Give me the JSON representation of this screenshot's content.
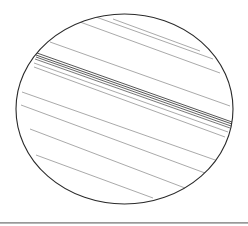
{
  "figure": {
    "type": "ellipse-with-parallel-striations",
    "colors": {
      "background": "#ffffff",
      "outline": "#2a2a2a",
      "lines": "#6e6e6e",
      "band": "#555555",
      "baseline": "#8a8a8a"
    },
    "ellipse": {
      "cx": 124.5,
      "cy": 109,
      "rx": 108.5,
      "ry": 95
    },
    "lines": [
      {
        "x1": 113,
        "y1": 19,
        "x2": 200,
        "y2": 51,
        "w": 0.6
      },
      {
        "x1": 96,
        "y1": 17,
        "x2": 213,
        "y2": 59,
        "w": 0.6
      },
      {
        "x1": 80,
        "y1": 22,
        "x2": 220,
        "y2": 73,
        "w": 0.6
      },
      {
        "x1": 50,
        "y1": 42,
        "x2": 230,
        "y2": 106,
        "w": 0.6
      },
      {
        "x1": 37,
        "y1": 53,
        "x2": 232,
        "y2": 122,
        "w": 1.0
      },
      {
        "x1": 36,
        "y1": 55,
        "x2": 232,
        "y2": 124,
        "w": 1.0
      },
      {
        "x1": 36,
        "y1": 57,
        "x2": 231,
        "y2": 126,
        "w": 0.9
      },
      {
        "x1": 35,
        "y1": 59,
        "x2": 230,
        "y2": 128,
        "w": 0.8
      },
      {
        "x1": 34,
        "y1": 63,
        "x2": 228,
        "y2": 132,
        "w": 0.6
      },
      {
        "x1": 34,
        "y1": 67,
        "x2": 225,
        "y2": 137,
        "w": 0.6
      },
      {
        "x1": 22,
        "y1": 92,
        "x2": 218,
        "y2": 161,
        "w": 0.6
      },
      {
        "x1": 21,
        "y1": 105,
        "x2": 205,
        "y2": 173,
        "w": 0.6
      },
      {
        "x1": 30,
        "y1": 129,
        "x2": 185,
        "y2": 188,
        "w": 0.6
      },
      {
        "x1": 36,
        "y1": 155,
        "x2": 153,
        "y2": 198,
        "w": 0.6
      }
    ]
  }
}
